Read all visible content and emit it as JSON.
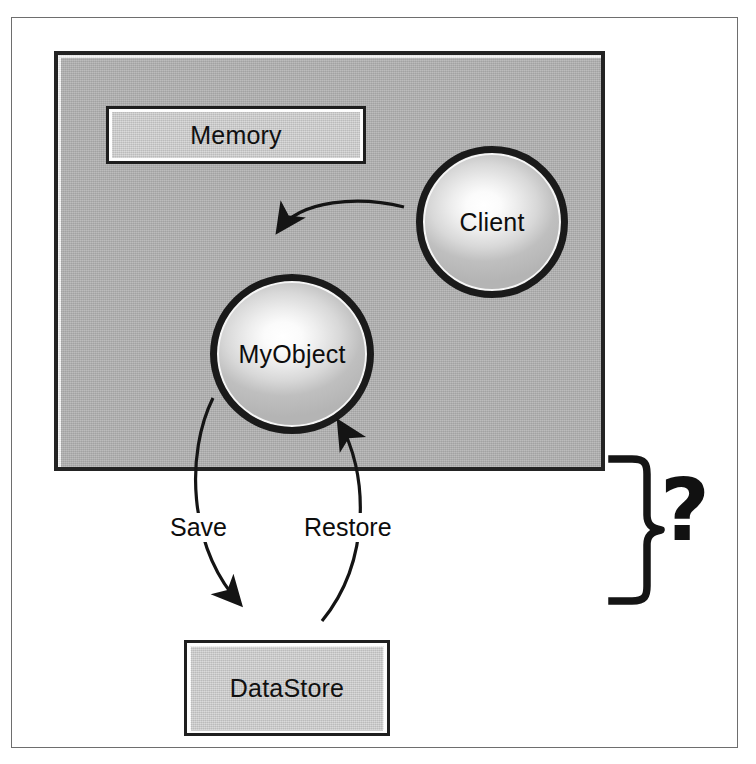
{
  "figure": {
    "caption_present": false,
    "nodes": {
      "memory_panel": {
        "label": "Memory",
        "type": "container-box"
      },
      "client": {
        "label": "Client",
        "type": "ellipse"
      },
      "myobject": {
        "label": "MyObject",
        "type": "ellipse"
      },
      "datastore": {
        "label": "DataStore",
        "type": "box"
      }
    },
    "edges": [
      {
        "name": "client-to-myobject",
        "label": "",
        "from": "Client",
        "to": "MyObject"
      },
      {
        "name": "myobject-to-datastore",
        "label": "Save",
        "from": "MyObject",
        "to": "DataStore"
      },
      {
        "name": "datastore-to-myobject",
        "label": "Restore",
        "from": "DataStore",
        "to": "MyObject"
      }
    ],
    "annotation": {
      "brace": "}",
      "question_mark": "?"
    },
    "colors": {
      "panel_fill": "#afafaf",
      "box_fill": "#cdcdcd",
      "stroke": "#1a1a1a",
      "frame": "#6e6e6e",
      "background": "#ffffff",
      "text": "#0d0d0d"
    }
  }
}
